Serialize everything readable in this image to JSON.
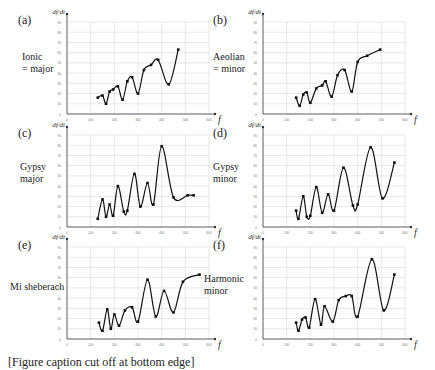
{
  "figure": {
    "caption_partial": "[Figure caption cut off at bottom edge]",
    "y_axis_label": "df/dt",
    "x_axis_label": "f",
    "x_ticks": [
      0,
      100,
      200,
      300,
      400,
      500,
      600
    ],
    "y_ticks": [
      0,
      10,
      20,
      30,
      40,
      50,
      60,
      70,
      80,
      90
    ]
  },
  "chart_data": [
    {
      "type": "line",
      "panel": "(a)",
      "title": "Ionic = major",
      "xlabel": "f",
      "ylabel": "df/dt",
      "xlim": [
        0,
        600
      ],
      "ylim": [
        0,
        90
      ],
      "grid": true,
      "x": [
        130,
        150,
        165,
        180,
        195,
        215,
        235,
        255,
        275,
        300,
        325,
        355,
        385,
        430,
        470
      ],
      "y": [
        16,
        18,
        10,
        22,
        24,
        27,
        14,
        32,
        36,
        20,
        43,
        48,
        53,
        29,
        63
      ]
    },
    {
      "type": "line",
      "panel": "(b)",
      "title": "Aeolian = minor",
      "xlabel": "f",
      "ylabel": "df/dt",
      "xlim": [
        0,
        600
      ],
      "ylim": [
        0,
        90
      ],
      "grid": true,
      "x": [
        140,
        155,
        170,
        185,
        200,
        225,
        250,
        265,
        290,
        315,
        345,
        375,
        400,
        440,
        495
      ],
      "y": [
        16,
        8,
        19,
        21,
        11,
        25,
        28,
        32,
        17,
        38,
        43,
        22,
        51,
        57,
        63
      ]
    },
    {
      "type": "line",
      "panel": "(c)",
      "title": "Gypsy major",
      "xlabel": "f",
      "ylabel": "df/dt",
      "xlim": [
        0,
        600
      ],
      "ylim": [
        0,
        90
      ],
      "grid": true,
      "x": [
        130,
        150,
        165,
        180,
        195,
        215,
        240,
        255,
        285,
        310,
        340,
        365,
        400,
        450,
        510,
        535
      ],
      "y": [
        8,
        27,
        10,
        22,
        11,
        40,
        15,
        16,
        52,
        20,
        43,
        22,
        79,
        29,
        31,
        31
      ]
    },
    {
      "type": "line",
      "panel": "(d)",
      "title": "Gypsy minor",
      "xlabel": "f",
      "ylabel": "df/dt",
      "xlim": [
        0,
        600
      ],
      "ylim": [
        0,
        90
      ],
      "grid": true,
      "x": [
        140,
        150,
        170,
        185,
        200,
        225,
        250,
        275,
        300,
        340,
        380,
        400,
        455,
        505,
        555
      ],
      "y": [
        16,
        8,
        30,
        10,
        11,
        39,
        14,
        32,
        16,
        58,
        21,
        22,
        78,
        28,
        63
      ]
    },
    {
      "type": "line",
      "panel": "(e)",
      "title": "Mi sheberach",
      "xlabel": "f",
      "ylabel": "df/dt",
      "xlim": [
        0,
        600
      ],
      "ylim": [
        0,
        90
      ],
      "grid": true,
      "x": [
        135,
        150,
        170,
        185,
        200,
        220,
        245,
        275,
        300,
        340,
        375,
        410,
        450,
        490,
        560
      ],
      "y": [
        16,
        8,
        29,
        10,
        24,
        13,
        28,
        31,
        17,
        58,
        22,
        47,
        26,
        56,
        63
      ]
    },
    {
      "type": "line",
      "panel": "(f)",
      "title": "Harmonic minor",
      "xlabel": "f",
      "ylabel": "df/dt",
      "xlim": [
        0,
        600
      ],
      "ylim": [
        0,
        90
      ],
      "grid": true,
      "x": [
        140,
        150,
        165,
        180,
        195,
        220,
        245,
        260,
        295,
        320,
        350,
        375,
        400,
        460,
        510,
        555
      ],
      "y": [
        16,
        8,
        19,
        21,
        11,
        39,
        14,
        32,
        17,
        38,
        42,
        42,
        22,
        78,
        28,
        63
      ]
    }
  ],
  "panels": [
    {
      "id": "(a)",
      "name_lines": [
        "Ionic",
        "= major"
      ]
    },
    {
      "id": "(b)",
      "name_lines": [
        "Aeolian",
        "= minor"
      ]
    },
    {
      "id": "(c)",
      "name_lines": [
        "Gypsy",
        "major"
      ]
    },
    {
      "id": "(d)",
      "name_lines": [
        "Gypsy",
        "minor"
      ]
    },
    {
      "id": "(e)",
      "name_lines": [
        "Mi sheberach"
      ]
    },
    {
      "id": "(f)",
      "name_lines": [
        "Harmonic",
        "minor"
      ]
    }
  ]
}
